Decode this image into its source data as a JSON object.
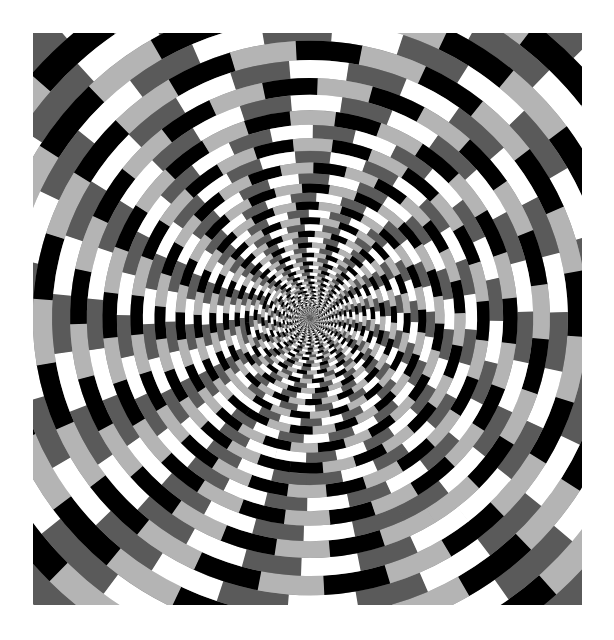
{
  "image": {
    "description": "Spiral tunnel checkerboard optical illusion",
    "frame": {
      "left": 33,
      "top": 33,
      "width": 549,
      "height": 572
    },
    "center": {
      "x": 277,
      "y": 285
    },
    "background": "#ffffff",
    "tones": [
      "#ffffff",
      "#b4b4b4",
      "#5a5a5a",
      "#000000"
    ],
    "rings": {
      "count": 60,
      "max_radius": 460,
      "min_radius": 3,
      "growth": 1.075,
      "segments_outer": 24,
      "segments_inner": 48,
      "twist_per_ring_deg": 6.5,
      "checker_shift_deg": 7.5
    }
  }
}
